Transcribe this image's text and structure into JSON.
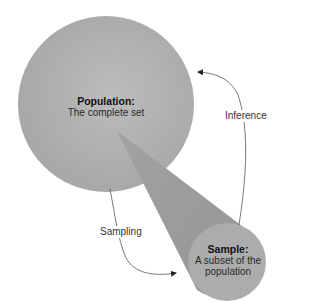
{
  "diagram": {
    "colors": {
      "background": "#ffffff",
      "population_fill": "#a9a9a9",
      "population_highlight": "#bdbdbd",
      "cone_fill": "#999999",
      "sample_fill": "#acacac",
      "arrow": "#333333"
    },
    "nodes": {
      "population": {
        "title": "Population:",
        "subtitle": "The complete set"
      },
      "sample": {
        "title": "Sample:",
        "subtitle_line1": "A subset of the",
        "subtitle_line2": "population"
      }
    },
    "edges": {
      "sampling": {
        "label": "Sampling",
        "from": "population",
        "to": "sample"
      },
      "inference": {
        "label": "Inference",
        "from": "sample",
        "to": "population"
      }
    }
  }
}
